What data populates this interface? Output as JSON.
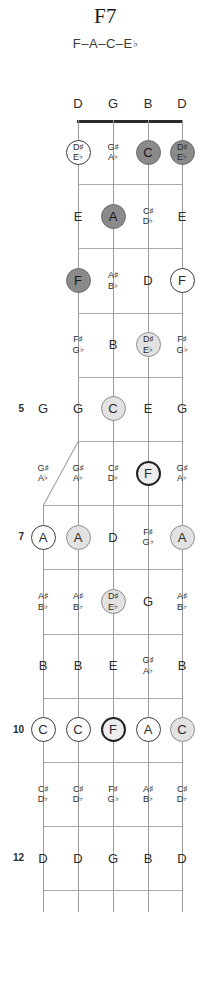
{
  "chord": {
    "title": "F7",
    "tones": "F–A–C–E♭"
  },
  "fretboard": {
    "instrument": "5-string banjo",
    "open_strings": [
      "D",
      "G",
      "B",
      "D"
    ],
    "fifth_string_start_fret": 5,
    "fret_count": 12,
    "fret_markers": [
      "5",
      "7",
      "10",
      "12"
    ],
    "legend": {
      "root_style": "root",
      "chord_tone_dark": "dark",
      "chord_tone_light": "light",
      "chord_tone_open": "open",
      "non_chord_tone": "plain"
    },
    "colors": {
      "nut": "#2b2b2b",
      "fret": "#a9a9a9",
      "string": "#9a9a9a",
      "disc_dark": "#8a8a8a",
      "disc_light": "#e2e2e2",
      "disc_open": "#ffffff",
      "root_border": "#222222",
      "text": "#2b2b2b"
    },
    "rows": [
      {
        "fret": 1,
        "marker": "",
        "notes": [
          {
            "label": "",
            "style": "none"
          },
          {
            "label": "D♯ E♭",
            "lines": [
              "D♯",
              "E♭"
            ],
            "style": "open"
          },
          {
            "label": "G♯ A♭",
            "lines": [
              "G♯",
              "A♭"
            ],
            "style": "plain"
          },
          {
            "label": "C",
            "lines": [
              "C"
            ],
            "style": "dark"
          },
          {
            "label": "D♯ E♭",
            "lines": [
              "D♯",
              "E♭"
            ],
            "style": "dark"
          }
        ]
      },
      {
        "fret": 2,
        "marker": "",
        "notes": [
          {
            "label": "",
            "style": "none"
          },
          {
            "label": "E",
            "lines": [
              "E"
            ],
            "style": "plain"
          },
          {
            "label": "A",
            "lines": [
              "A"
            ],
            "style": "dark"
          },
          {
            "label": "C♯ D♭",
            "lines": [
              "C♯",
              "D♭"
            ],
            "style": "plain"
          },
          {
            "label": "E",
            "lines": [
              "E"
            ],
            "style": "plain"
          }
        ]
      },
      {
        "fret": 3,
        "marker": "",
        "notes": [
          {
            "label": "",
            "style": "none"
          },
          {
            "label": "F",
            "lines": [
              "F"
            ],
            "style": "dark"
          },
          {
            "label": "A♯ B♭",
            "lines": [
              "A♯",
              "B♭"
            ],
            "style": "plain"
          },
          {
            "label": "D",
            "lines": [
              "D"
            ],
            "style": "plain"
          },
          {
            "label": "F",
            "lines": [
              "F"
            ],
            "style": "open"
          }
        ]
      },
      {
        "fret": 4,
        "marker": "",
        "notes": [
          {
            "label": "",
            "style": "none"
          },
          {
            "label": "F♯ G♭",
            "lines": [
              "F♯",
              "G♭"
            ],
            "style": "plain"
          },
          {
            "label": "B",
            "lines": [
              "B"
            ],
            "style": "plain"
          },
          {
            "label": "D♯ E♭",
            "lines": [
              "D♯",
              "E♭"
            ],
            "style": "light"
          },
          {
            "label": "F♯ G♭",
            "lines": [
              "F♯",
              "G♭"
            ],
            "style": "plain"
          }
        ]
      },
      {
        "fret": 5,
        "marker": "5",
        "notes": [
          {
            "label": "G",
            "lines": [
              "G"
            ],
            "style": "plain"
          },
          {
            "label": "G",
            "lines": [
              "G"
            ],
            "style": "plain"
          },
          {
            "label": "C",
            "lines": [
              "C"
            ],
            "style": "light"
          },
          {
            "label": "E",
            "lines": [
              "E"
            ],
            "style": "plain"
          },
          {
            "label": "G",
            "lines": [
              "G"
            ],
            "style": "plain"
          }
        ]
      },
      {
        "fret": 6,
        "marker": "",
        "notes": [
          {
            "label": "G♯ A♭",
            "lines": [
              "G♯",
              "A♭"
            ],
            "style": "plain"
          },
          {
            "label": "G♯ A♭",
            "lines": [
              "G♯",
              "A♭"
            ],
            "style": "plain"
          },
          {
            "label": "C♯ D♭",
            "lines": [
              "C♯",
              "D♭"
            ],
            "style": "plain"
          },
          {
            "label": "F",
            "lines": [
              "F"
            ],
            "style": "root"
          },
          {
            "label": "G♯ A♭",
            "lines": [
              "G♯",
              "A♭"
            ],
            "style": "plain"
          }
        ]
      },
      {
        "fret": 7,
        "marker": "7",
        "notes": [
          {
            "label": "A",
            "lines": [
              "A"
            ],
            "style": "open"
          },
          {
            "label": "A",
            "lines": [
              "A"
            ],
            "style": "light"
          },
          {
            "label": "D",
            "lines": [
              "D"
            ],
            "style": "plain"
          },
          {
            "label": "F♯ G♭",
            "lines": [
              "F♯",
              "G♭"
            ],
            "style": "plain"
          },
          {
            "label": "A",
            "lines": [
              "A"
            ],
            "style": "light"
          }
        ]
      },
      {
        "fret": 8,
        "marker": "",
        "notes": [
          {
            "label": "A♯ B♭",
            "lines": [
              "A♯",
              "B♭"
            ],
            "style": "plain"
          },
          {
            "label": "A♯ B♭",
            "lines": [
              "A♯",
              "B♭"
            ],
            "style": "plain"
          },
          {
            "label": "D♯ E♭",
            "lines": [
              "D♯",
              "E♭"
            ],
            "style": "light"
          },
          {
            "label": "G",
            "lines": [
              "G"
            ],
            "style": "plain"
          },
          {
            "label": "A♯ B♭",
            "lines": [
              "A♯",
              "B♭"
            ],
            "style": "plain"
          }
        ]
      },
      {
        "fret": 9,
        "marker": "",
        "notes": [
          {
            "label": "B",
            "lines": [
              "B"
            ],
            "style": "plain"
          },
          {
            "label": "B",
            "lines": [
              "B"
            ],
            "style": "plain"
          },
          {
            "label": "E",
            "lines": [
              "E"
            ],
            "style": "plain"
          },
          {
            "label": "G♯ A♭",
            "lines": [
              "G♯",
              "A♭"
            ],
            "style": "plain"
          },
          {
            "label": "B",
            "lines": [
              "B"
            ],
            "style": "plain"
          }
        ]
      },
      {
        "fret": 10,
        "marker": "10",
        "notes": [
          {
            "label": "C",
            "lines": [
              "C"
            ],
            "style": "open"
          },
          {
            "label": "C",
            "lines": [
              "C"
            ],
            "style": "open"
          },
          {
            "label": "F",
            "lines": [
              "F"
            ],
            "style": "root"
          },
          {
            "label": "A",
            "lines": [
              "A"
            ],
            "style": "open"
          },
          {
            "label": "C",
            "lines": [
              "C"
            ],
            "style": "light"
          }
        ]
      },
      {
        "fret": 11,
        "marker": "",
        "notes": [
          {
            "label": "C♯ D♭",
            "lines": [
              "C♯",
              "D♭"
            ],
            "style": "plain"
          },
          {
            "label": "C♯ D♭",
            "lines": [
              "C♯",
              "D♭"
            ],
            "style": "plain"
          },
          {
            "label": "F♯ G♭",
            "lines": [
              "F♯",
              "G♭"
            ],
            "style": "plain"
          },
          {
            "label": "A♯ B♭",
            "lines": [
              "A♯",
              "B♭"
            ],
            "style": "plain"
          },
          {
            "label": "C♯ D♭",
            "lines": [
              "C♯",
              "D♭"
            ],
            "style": "plain"
          }
        ]
      },
      {
        "fret": 12,
        "marker": "12",
        "notes": [
          {
            "label": "D",
            "lines": [
              "D"
            ],
            "style": "plain"
          },
          {
            "label": "D",
            "lines": [
              "D"
            ],
            "style": "plain"
          },
          {
            "label": "G",
            "lines": [
              "G"
            ],
            "style": "plain"
          },
          {
            "label": "B",
            "lines": [
              "B"
            ],
            "style": "plain"
          },
          {
            "label": "D",
            "lines": [
              "D"
            ],
            "style": "plain"
          }
        ]
      }
    ]
  }
}
